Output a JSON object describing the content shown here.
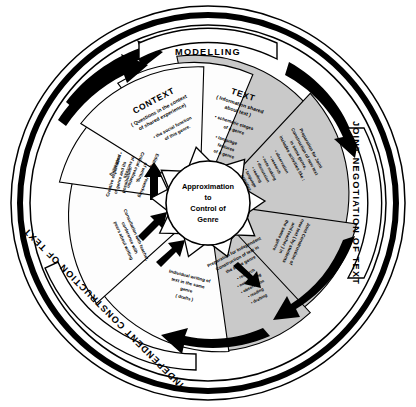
{
  "diagram": {
    "hub": {
      "line1": "Approximation",
      "line2": "to",
      "line3": "Control of",
      "line4": "Genre"
    },
    "banners": [
      {
        "id": "modelling",
        "label": "MODELLING"
      },
      {
        "id": "joint-negotiation",
        "label": "JOINT NEGOTIATION OF TEXT"
      },
      {
        "id": "independent-construction",
        "label": "INDEPENDENT CONSTRUCTION OF TEXT"
      }
    ],
    "segments": [
      {
        "id": "context",
        "heading": "CONTEXT",
        "subtitle_line1": "( Questions in the context",
        "subtitle_line2": "of shared experience)",
        "bullet_line1": "•  the social function",
        "bullet_line2": "of this genre.",
        "shade": "grey"
      },
      {
        "id": "text",
        "heading": "TEXT",
        "subtitle_line1": "( Information shared",
        "subtitle_line2": "about text )",
        "bullet1_line1": "•  schematic stages",
        "bullet1_line2": "of a genre",
        "bullet2_line1": "•  language",
        "bullet2_line2": "features",
        "bullet2_line3": "of a genre",
        "shade": "grey"
      },
      {
        "id": "preparation-joint",
        "line1": "Preparation for Joint",
        "line2": "Construction of new text",
        "line3": "in same genre,",
        "line4": "includes activities like :",
        "bullets": [
          "• observation",
          "• research",
          "• note making",
          "• discussion",
          "• reading",
          "• language",
          "activities"
        ],
        "shade": "grey"
      },
      {
        "id": "joint-construction",
        "line1": "Joint Construction of",
        "line2": "new text ( by students",
        "line3": "and teacher ) in",
        "line4": "the same genre",
        "shade": "grey"
      },
      {
        "id": "preparation-independent",
        "line1": "Preparation for Independent",
        "line2": "Construction of text in",
        "line3": "the same genre",
        "bullets": [
          "• research",
          "• note making",
          "• observation",
          "• reading",
          "• drafting"
        ],
        "shade": "white"
      },
      {
        "id": "individual-writing",
        "line1": "Individual writing of",
        "line2": "text in the same",
        "line3": "genre",
        "line4": "( drafts )",
        "shade": "white"
      },
      {
        "id": "consultation",
        "line1": "Consultation with teacher,",
        "line2": "conference with",
        "line3": "peers about writing",
        "shade": "white"
      },
      {
        "id": "editing",
        "line1": "Editing and reworking",
        "line2": "of writing,",
        "line3": "Critical evaluation",
        "line4": "of success",
        "bullet1": "•  publishing",
        "shade": "white"
      },
      {
        "id": "creative-exploration",
        "line1": "Creative exploration",
        "line2": "of genre and its",
        "line3": "possibilities.",
        "shade": "white"
      }
    ],
    "colors": {
      "segment_shaded": "#c9c9c9",
      "segment_plain": "#fdfdfd",
      "outline": "#000000",
      "background": "#ffffff"
    }
  }
}
